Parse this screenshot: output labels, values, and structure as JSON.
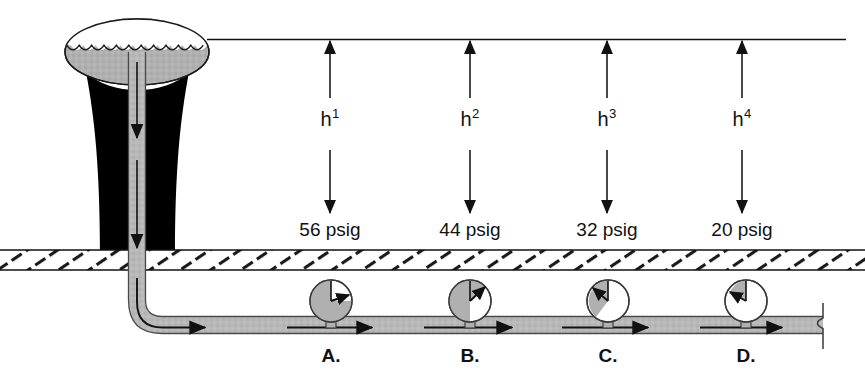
{
  "diagram": {
    "reference_line_label": "water-surface-reference-line",
    "colors": {
      "tank_fill": "#b0b0b0",
      "tower_fill": "#000000",
      "pipe_fill": "#b8b8b8",
      "gauge_fill": "#b0b0b0",
      "gauge_empty": "#ffffff",
      "ground_line": "#111111",
      "ink": "#111111",
      "background": "#ffffff"
    },
    "structures": {
      "tank_name": "elevated-water-tank",
      "tower_name": "tower-support-column",
      "riser_name": "vertical-riser-pipe",
      "main_name": "horizontal-water-main",
      "ground_name": "ground-hatching-band"
    },
    "heights": [
      {
        "id": "h1",
        "text": "h",
        "exponent": "1",
        "x": 330,
        "label_y": 118,
        "top_y": 40,
        "bottom_y": 215
      },
      {
        "id": "h2",
        "text": "h",
        "exponent": "2",
        "x": 470,
        "label_y": 118,
        "top_y": 40,
        "bottom_y": 215
      },
      {
        "id": "h3",
        "text": "h",
        "exponent": "3",
        "x": 607,
        "label_y": 118,
        "top_y": 40,
        "bottom_y": 215
      },
      {
        "id": "h4",
        "text": "h",
        "exponent": "4",
        "x": 742,
        "label_y": 118,
        "top_y": 40,
        "bottom_y": 215
      }
    ],
    "pressures": [
      {
        "id": "p-a",
        "value": "56 psig",
        "x": 330,
        "y": 224
      },
      {
        "id": "p-b",
        "value": "44 psig",
        "x": 470,
        "y": 224
      },
      {
        "id": "p-c",
        "value": "32 psig",
        "x": 607,
        "y": 224
      },
      {
        "id": "p-d",
        "value": "20 psig",
        "x": 742,
        "y": 224
      }
    ],
    "gauges": [
      {
        "id": "gauge-a",
        "label": "A.",
        "x": 331,
        "cy": 301,
        "r": 21,
        "needle_deg": 78,
        "fill_fraction": 0.78,
        "label_x": 331,
        "label_y": 352
      },
      {
        "id": "gauge-b",
        "label": "B.",
        "x": 470,
        "cy": 301,
        "r": 21,
        "needle_deg": 42,
        "fill_fraction": 0.6,
        "label_x": 470,
        "label_y": 352
      },
      {
        "id": "gauge-c",
        "label": "C.",
        "x": 608,
        "cy": 301,
        "r": 21,
        "needle_deg": -38,
        "fill_fraction": 0.42,
        "label_x": 608,
        "label_y": 352
      },
      {
        "id": "gauge-d",
        "label": "D.",
        "x": 746,
        "cy": 301,
        "r": 21,
        "needle_deg": -56,
        "fill_fraction": 0.24,
        "label_x": 746,
        "label_y": 352
      }
    ],
    "flow_arrows": [
      {
        "id": "flow-riser-upper",
        "orientation": "down"
      },
      {
        "id": "flow-riser-lower",
        "orientation": "down"
      },
      {
        "id": "flow-elbow",
        "orientation": "curved-right"
      },
      {
        "id": "flow-main-1",
        "orientation": "right"
      },
      {
        "id": "flow-main-2",
        "orientation": "right"
      },
      {
        "id": "flow-main-3",
        "orientation": "right"
      },
      {
        "id": "flow-main-4",
        "orientation": "right"
      }
    ],
    "terminal": {
      "name": "pipe-crossover-riser",
      "x": 823
    }
  }
}
